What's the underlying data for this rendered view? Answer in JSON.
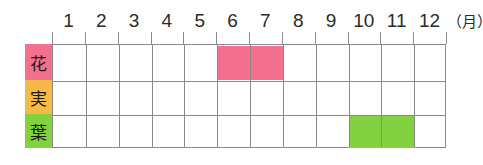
{
  "chart_data": {
    "type": "bar",
    "title": "",
    "subtitle": "",
    "xlabel": "月",
    "ylabel": "",
    "orientation": "horizontal",
    "grid": true,
    "legend": "none",
    "x_unit_label": "（月）",
    "x_axis_range": [
      1,
      12
    ],
    "categories": [
      "1",
      "2",
      "3",
      "4",
      "5",
      "6",
      "7",
      "8",
      "9",
      "10",
      "11",
      "12"
    ],
    "row_categories": [
      "花",
      "実",
      "葉"
    ],
    "series": [
      {
        "name": "花",
        "label": "花",
        "label_bg_color": "#F4708F",
        "bar_color": "#F4708F",
        "months": [
          6,
          7
        ],
        "start_month": 6,
        "end_month": 7,
        "values": [
          0,
          0,
          0,
          0,
          0,
          1,
          1,
          0,
          0,
          0,
          0,
          0
        ]
      },
      {
        "name": "実",
        "label": "実",
        "label_bg_color": "#F6B847",
        "bar_color": "#F6B847",
        "months": [],
        "start_month": null,
        "end_month": null,
        "values": [
          0,
          0,
          0,
          0,
          0,
          0,
          0,
          0,
          0,
          0,
          0,
          0
        ]
      },
      {
        "name": "葉",
        "label": "葉",
        "label_bg_color": "#82D23F",
        "bar_color": "#82D23F",
        "months": [
          10,
          11
        ],
        "start_month": 10,
        "end_month": 11,
        "values": [
          0,
          0,
          0,
          0,
          0,
          0,
          0,
          0,
          0,
          1,
          1,
          0
        ]
      }
    ],
    "colors": {
      "flower": "#F4708F",
      "fruit": "#F6B847",
      "leaf": "#82D23F",
      "grid_line": "#8a8a8a",
      "text": "#2b2b2b",
      "background": "#ffffff"
    }
  },
  "header": {
    "months": [
      "1",
      "2",
      "3",
      "4",
      "5",
      "6",
      "7",
      "8",
      "9",
      "10",
      "11",
      "12"
    ],
    "unit": "（月）"
  },
  "rows": [
    {
      "label": "花",
      "name": "flower"
    },
    {
      "label": "実",
      "name": "fruit"
    },
    {
      "label": "葉",
      "name": "leaf"
    }
  ]
}
